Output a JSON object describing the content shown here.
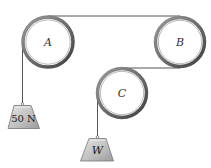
{
  "diagram": {
    "type": "pulley-system",
    "pulleys": [
      {
        "id": "A",
        "label": "A",
        "cx": 48,
        "cy": 42,
        "r": 26
      },
      {
        "id": "B",
        "label": "B",
        "cx": 180,
        "cy": 42,
        "r": 25
      },
      {
        "id": "C",
        "label": "C",
        "cx": 122,
        "cy": 93,
        "r": 25
      }
    ],
    "weights": [
      {
        "id": "weight-left",
        "label": "50 N",
        "hangs_from": "A"
      },
      {
        "id": "weight-w",
        "label": "W",
        "hangs_from": "C"
      }
    ],
    "colors": {
      "rope": "#555555",
      "pulley_rim": "#6b6b6b",
      "pulley_inner": "#ffffff",
      "weight_fill": "#c9c9c9",
      "weight_shade": "#a8a8a8"
    }
  }
}
